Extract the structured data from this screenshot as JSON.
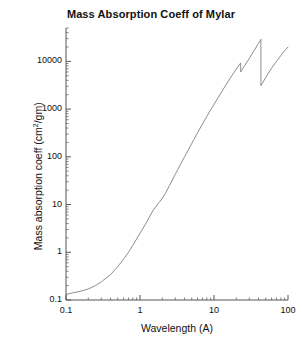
{
  "chart": {
    "title": "Mass Absorption Coeff of Mylar",
    "xlabel": "Wavelength (A)",
    "ylabel_main": "Mass absorption coeff (cm",
    "ylabel_sup": "2",
    "ylabel_tail": "/gm)",
    "ylabel_full": "Mass absorption coeff (cm2/gm)",
    "line_color": "#808080",
    "axis_color": "#555555",
    "text_color": "#111111",
    "background": "#ffffff"
  },
  "y_ticks": [
    {
      "value": 10000,
      "label": "10000"
    },
    {
      "value": 1000,
      "label": "1000"
    },
    {
      "value": 100,
      "label": "100"
    },
    {
      "value": 10,
      "label": "10"
    },
    {
      "value": 1,
      "label": "1"
    },
    {
      "value": 0.1,
      "label": "0.1"
    }
  ],
  "x_ticks": [
    {
      "value": 0.1,
      "label": "0.1"
    },
    {
      "value": 1,
      "label": "1"
    },
    {
      "value": 10,
      "label": "10"
    },
    {
      "value": 100,
      "label": "100"
    }
  ],
  "chart_data": {
    "type": "line",
    "title": "Mass Absorption Coeff of Mylar",
    "xlabel": "Wavelength (A)",
    "ylabel": "Mass absorption coeff (cm2/gm)",
    "xscale": "log",
    "yscale": "log",
    "xlim": [
      0.1,
      100
    ],
    "ylim": [
      0.1,
      50000
    ],
    "grid": false,
    "legend": "none",
    "series": [
      {
        "name": "Mylar mass absorption coefficient",
        "x": [
          0.1,
          0.12,
          0.15,
          0.2,
          0.25,
          0.3,
          0.4,
          0.5,
          0.6,
          0.7,
          0.8,
          0.9,
          1.0,
          1.2,
          1.5,
          1.8,
          2.0,
          2.2,
          2.5,
          3.0,
          3.5,
          4.0,
          5.0,
          6.0,
          7.0,
          8.0,
          9.0,
          10.0,
          12.0,
          15.0,
          18.0,
          20.0,
          22.0,
          22.9,
          23.0,
          26.0,
          30.0,
          35.0,
          40.0,
          43.0,
          43.1,
          50.0,
          60.0,
          70.0,
          85.0,
          100.0
        ],
        "y": [
          0.13,
          0.14,
          0.15,
          0.17,
          0.2,
          0.24,
          0.34,
          0.5,
          0.72,
          1.0,
          1.4,
          1.9,
          2.5,
          4.0,
          7.5,
          11.0,
          13.5,
          17.0,
          25.0,
          43.0,
          68.0,
          100.0,
          190.0,
          320.0,
          490.0,
          700.0,
          960.0,
          1250.0,
          2000.0,
          3500.0,
          5400.0,
          6900.0,
          8500.0,
          9200.0,
          6000.0,
          8200.0,
          11500.0,
          17000.0,
          24000.0,
          29000.0,
          3100.0,
          4600.0,
          7200.0,
          10000.0,
          15000.0,
          20000.0
        ]
      }
    ],
    "annotations": [
      {
        "name": "carbon-K-edge",
        "x": 23.0,
        "note": "absorption edge: drop from ~9200 to ~6000"
      },
      {
        "name": "oxygen-K-edge",
        "x": 43.0,
        "note": "absorption edge: drop from ~29000 to ~3100"
      }
    ]
  }
}
